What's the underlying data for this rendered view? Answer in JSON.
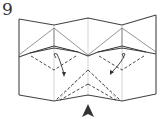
{
  "diagram": {
    "type": "origami-step",
    "step_number": "9",
    "colors": {
      "outline": "#444444",
      "crease": "#999999",
      "valley": "#333333",
      "arrow": "#333333"
    },
    "elements": [
      "zigzag-paper-outline",
      "left-squash-fold",
      "right-squash-fold",
      "center-valley-fold-triangle",
      "push-arrow-bottom"
    ]
  }
}
